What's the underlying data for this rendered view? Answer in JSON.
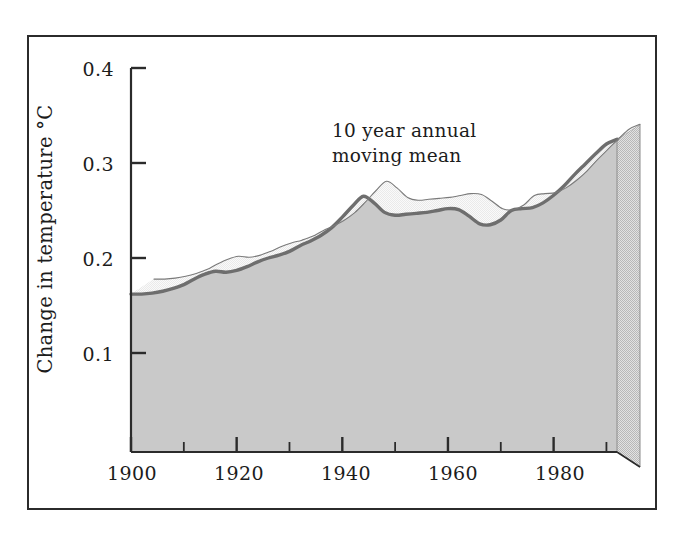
{
  "figure": {
    "background": "#ffffff",
    "frame_color": "#2b2b2b",
    "area_fill": "#c9c9c9",
    "curve_color": "#6e6e6e",
    "side_face_fill": "#d9d9d9",
    "ribbon_fill": "#ffffff"
  },
  "chart_data": {
    "type": "area",
    "title": "",
    "subtitle": "",
    "xlabel": "",
    "ylabel": "Change in temperature °C",
    "annotation": "10 year annual\nmoving mean",
    "annotations": [
      "10 year annual",
      "moving mean"
    ],
    "legend": [],
    "legend_position": "none",
    "grid": false,
    "xlim": [
      1900,
      1992
    ],
    "ylim": [
      0,
      0.4
    ],
    "xticks": [
      1900,
      1920,
      1940,
      1960,
      1980
    ],
    "xtick_labels": [
      "1900",
      "1920",
      "1940",
      "1960",
      "1980"
    ],
    "xminor_ticks": [
      1910,
      1930,
      1950,
      1970,
      1990
    ],
    "yticks": [
      0.1,
      0.2,
      0.3,
      0.4
    ],
    "ytick_labels": [
      "0.1",
      "0.2",
      "0.3",
      "0.4"
    ],
    "series": [
      {
        "name": "10 year annual moving mean",
        "x": [
          1900,
          1902,
          1904,
          1906,
          1908,
          1910,
          1912,
          1914,
          1916,
          1918,
          1920,
          1922,
          1924,
          1926,
          1928,
          1930,
          1932,
          1934,
          1936,
          1938,
          1940,
          1942,
          1944,
          1946,
          1948,
          1950,
          1952,
          1954,
          1956,
          1958,
          1960,
          1962,
          1964,
          1966,
          1968,
          1970,
          1972,
          1974,
          1976,
          1978,
          1980,
          1982,
          1984,
          1986,
          1988,
          1990,
          1992
        ],
        "values": [
          0.162,
          0.162,
          0.163,
          0.165,
          0.168,
          0.172,
          0.178,
          0.183,
          0.186,
          0.185,
          0.187,
          0.191,
          0.196,
          0.2,
          0.203,
          0.207,
          0.213,
          0.218,
          0.224,
          0.232,
          0.243,
          0.255,
          0.265,
          0.258,
          0.248,
          0.245,
          0.246,
          0.247,
          0.248,
          0.25,
          0.252,
          0.251,
          0.244,
          0.236,
          0.235,
          0.24,
          0.25,
          0.252,
          0.253,
          0.258,
          0.266,
          0.276,
          0.288,
          0.299,
          0.31,
          0.32,
          0.325
        ]
      }
    ]
  }
}
